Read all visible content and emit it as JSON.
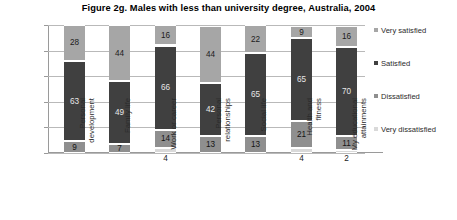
{
  "chart_data": {
    "type": "bar",
    "subtype": "stacked-100-percent",
    "title": "Figure 2g.  Males with less than university degree, Australia, 2004",
    "xlabel": "",
    "ylabel": "",
    "ylim": [
      0,
      100
    ],
    "yticks": [
      "0%",
      "20%",
      "40%",
      "60%",
      "80%",
      "100%"
    ],
    "ytick_values": [
      0,
      20,
      40,
      60,
      80,
      100
    ],
    "grid": true,
    "legend_position": "right",
    "categories": [
      "Personal\ndevelopment",
      "Family life",
      "Work or career",
      "Personal\nrelationships",
      "Social life",
      "Health and fitness",
      "My educational\nattainments"
    ],
    "series": [
      {
        "name": "Very satisfied",
        "color": "#a6a6a6",
        "values": [
          28,
          44,
          16,
          44,
          22,
          9,
          16
        ]
      },
      {
        "name": "Satisfied",
        "color": "#404040",
        "values": [
          63,
          49,
          66,
          42,
          65,
          65,
          70
        ]
      },
      {
        "name": "Dissatisfied",
        "color": "#8f8f8f",
        "values": [
          9,
          7,
          14,
          13,
          13,
          21,
          11
        ]
      },
      {
        "name": "Very dissatisfied",
        "color": "#d9d9d9",
        "values": [
          null,
          null,
          4,
          null,
          null,
          4,
          2
        ]
      }
    ]
  },
  "legend": {
    "items": [
      {
        "label": "Very satisfied",
        "color": "#a6a6a6"
      },
      {
        "label": "Satisfied",
        "color": "#404040"
      },
      {
        "label": "Dissatisfied",
        "color": "#8f8f8f"
      },
      {
        "label": "Very dissatisfied",
        "color": "#d9d9d9"
      }
    ]
  }
}
